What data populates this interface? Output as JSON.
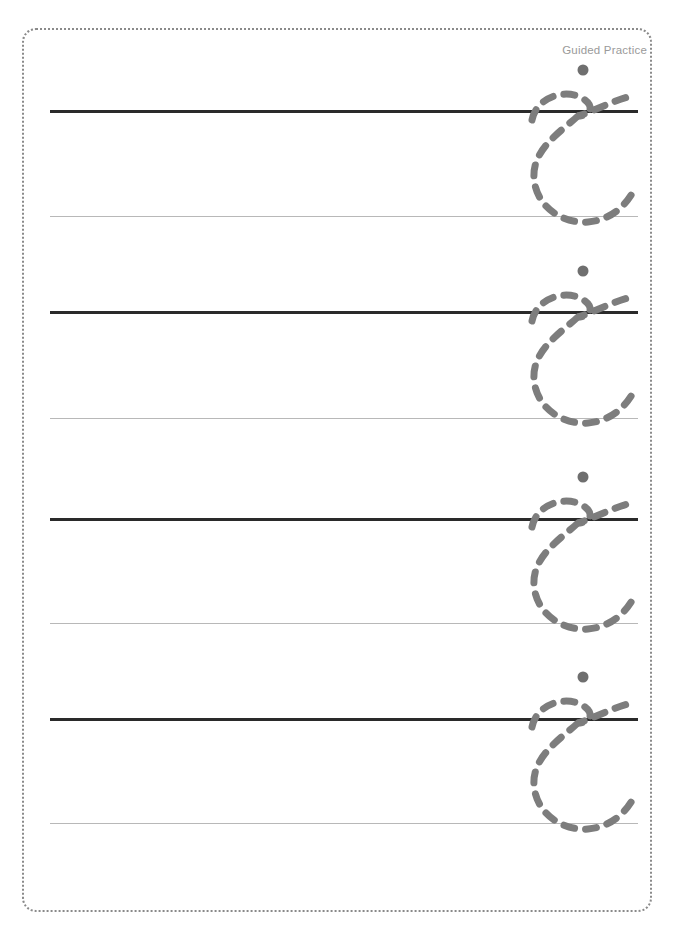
{
  "page": {
    "title": "Guided Practice",
    "width": 677,
    "height": 950,
    "background_color": "#ffffff",
    "border_color": "#8a8a8a",
    "border_style": "dotted"
  },
  "header": {
    "label": "Guided Practice",
    "color": "#9a9a9a",
    "align": "right"
  },
  "rules": {
    "thick_color": "#2a2a2a",
    "thin_color": "#b8b8b8",
    "left_x": 50,
    "right_x": 638,
    "rows": [
      {
        "index": 1,
        "thick_y": 110,
        "thin_y": 216
      },
      {
        "index": 2,
        "thick_y": 311,
        "thin_y": 418
      },
      {
        "index": 3,
        "thick_y": 518,
        "thin_y": 623
      },
      {
        "index": 4,
        "thick_y": 718,
        "thin_y": 823
      }
    ]
  },
  "tracing": {
    "letter_name": "arabic-letter-jeem",
    "stroke_color": "#7d7d7d",
    "dot_color": "#6f6f6f",
    "stroke_style": "dashed",
    "stroke_width": 7,
    "dash_pattern": "11 11",
    "count": 4,
    "glyphs": [
      {
        "index": 1,
        "x": 516,
        "y": 58,
        "row": 1
      },
      {
        "index": 2,
        "x": 516,
        "y": 259,
        "row": 2
      },
      {
        "index": 3,
        "x": 516,
        "y": 465,
        "row": 3
      },
      {
        "index": 4,
        "x": 516,
        "y": 665,
        "row": 4
      }
    ]
  }
}
